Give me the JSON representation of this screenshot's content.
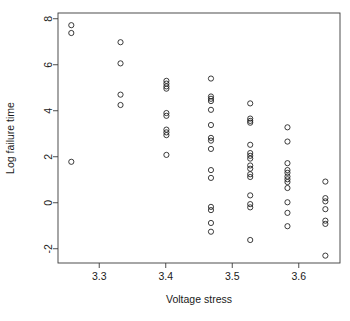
{
  "chart_data": {
    "type": "scatter",
    "title": "",
    "xlabel": "Voltage stress",
    "ylabel": "Log failure time",
    "xlim": [
      3.238,
      3.662
    ],
    "ylim": [
      -2.62,
      8.25
    ],
    "xticks": [
      3.3,
      3.4,
      3.5,
      3.6
    ],
    "xtick_labels": [
      "3.3",
      "3.4",
      "3.5",
      "3.6"
    ],
    "yticks": [
      -2,
      0,
      2,
      4,
      6,
      8
    ],
    "ytick_labels": [
      "-2",
      "0",
      "2",
      "4",
      "6",
      "8"
    ],
    "grid": false,
    "legend": null,
    "marker": "open-circle",
    "marker_color": "#1a1a1a",
    "frame": true,
    "points": [
      {
        "x": 3.258,
        "y": 7.72
      },
      {
        "x": 3.258,
        "y": 7.38
      },
      {
        "x": 3.258,
        "y": 1.78
      },
      {
        "x": 3.332,
        "y": 6.98
      },
      {
        "x": 3.332,
        "y": 6.06
      },
      {
        "x": 3.332,
        "y": 4.7
      },
      {
        "x": 3.332,
        "y": 4.25
      },
      {
        "x": 3.401,
        "y": 5.3
      },
      {
        "x": 3.401,
        "y": 5.18
      },
      {
        "x": 3.401,
        "y": 5.06
      },
      {
        "x": 3.401,
        "y": 4.96
      },
      {
        "x": 3.401,
        "y": 3.9
      },
      {
        "x": 3.401,
        "y": 3.78
      },
      {
        "x": 3.401,
        "y": 3.18
      },
      {
        "x": 3.401,
        "y": 3.06
      },
      {
        "x": 3.401,
        "y": 2.94
      },
      {
        "x": 3.401,
        "y": 2.08
      },
      {
        "x": 3.468,
        "y": 5.4
      },
      {
        "x": 3.468,
        "y": 4.62
      },
      {
        "x": 3.468,
        "y": 4.52
      },
      {
        "x": 3.468,
        "y": 4.42
      },
      {
        "x": 3.468,
        "y": 4.04
      },
      {
        "x": 3.468,
        "y": 3.38
      },
      {
        "x": 3.468,
        "y": 2.82
      },
      {
        "x": 3.468,
        "y": 2.7
      },
      {
        "x": 3.468,
        "y": 2.34
      },
      {
        "x": 3.468,
        "y": 1.42
      },
      {
        "x": 3.468,
        "y": 1.08
      },
      {
        "x": 3.468,
        "y": -0.18
      },
      {
        "x": 3.468,
        "y": -0.32
      },
      {
        "x": 3.468,
        "y": -0.88
      },
      {
        "x": 3.468,
        "y": -1.26
      },
      {
        "x": 3.527,
        "y": 4.32
      },
      {
        "x": 3.527,
        "y": 3.66
      },
      {
        "x": 3.527,
        "y": 3.56
      },
      {
        "x": 3.527,
        "y": 3.48
      },
      {
        "x": 3.527,
        "y": 2.52
      },
      {
        "x": 3.527,
        "y": 2.16
      },
      {
        "x": 3.527,
        "y": 2.04
      },
      {
        "x": 3.527,
        "y": 1.92
      },
      {
        "x": 3.527,
        "y": 1.62
      },
      {
        "x": 3.527,
        "y": 1.48
      },
      {
        "x": 3.527,
        "y": 1.24
      },
      {
        "x": 3.527,
        "y": 1.12
      },
      {
        "x": 3.527,
        "y": 0.32
      },
      {
        "x": 3.527,
        "y": -0.06
      },
      {
        "x": 3.527,
        "y": -0.2
      },
      {
        "x": 3.527,
        "y": -1.62
      },
      {
        "x": 3.583,
        "y": 3.28
      },
      {
        "x": 3.583,
        "y": 2.66
      },
      {
        "x": 3.583,
        "y": 1.72
      },
      {
        "x": 3.583,
        "y": 1.42
      },
      {
        "x": 3.583,
        "y": 1.3
      },
      {
        "x": 3.583,
        "y": 1.14
      },
      {
        "x": 3.583,
        "y": 1.02
      },
      {
        "x": 3.583,
        "y": 0.9
      },
      {
        "x": 3.583,
        "y": 0.64
      },
      {
        "x": 3.583,
        "y": 0.02
      },
      {
        "x": 3.583,
        "y": -0.44
      },
      {
        "x": 3.583,
        "y": -1.02
      },
      {
        "x": 3.64,
        "y": 0.92
      },
      {
        "x": 3.64,
        "y": 0.2
      },
      {
        "x": 3.64,
        "y": 0.06
      },
      {
        "x": 3.64,
        "y": -0.28
      },
      {
        "x": 3.64,
        "y": -0.78
      },
      {
        "x": 3.64,
        "y": -0.92
      },
      {
        "x": 3.64,
        "y": -2.3
      }
    ]
  },
  "axes": {
    "x_title": "Voltage stress",
    "y_title": "Log failure time"
  }
}
